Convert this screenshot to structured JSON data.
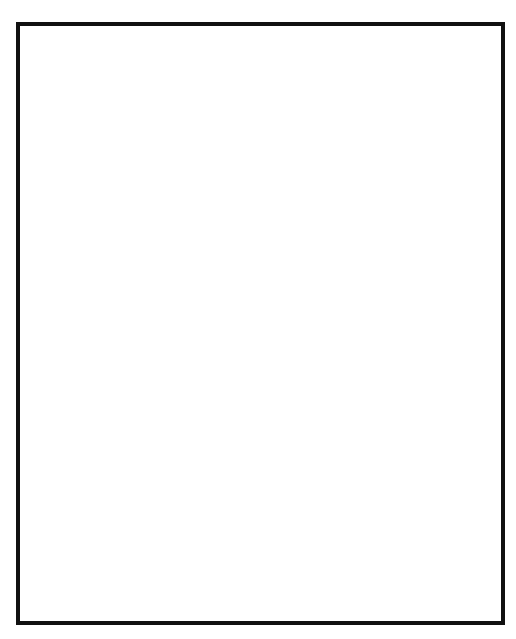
{
  "figure": {
    "kind": "architectural line drawing",
    "frame": {
      "x": 16,
      "y": 22,
      "width": 489,
      "height": 603,
      "stroke": "#111111",
      "stroke_width": 4,
      "fill": "#ffffff"
    },
    "palette": {
      "ink": "#111111",
      "paper": "#ffffff",
      "stipple_dot": "#111111"
    },
    "stipple": {
      "pattern": "regular dot grid",
      "dot_radius": 1.35,
      "spacing": 6.2,
      "region": "right half of drawing, x greater than 253"
    },
    "section_split": {
      "label": "cut plane / stipple boundary",
      "x": 253,
      "y_top": 24,
      "y_bottom": 623
    }
  },
  "elements": {
    "upper_vault": {
      "name": "barrel / groin vault web",
      "course_count": 13,
      "note": "curved horizontal bed joints sweeping from upper left down to the right"
    },
    "central_dome": {
      "name": "central vault cell",
      "cx": 253,
      "cy": 180,
      "rx": 72,
      "ry": 88,
      "ring_voussoirs": 15,
      "inner_courses": 9
    },
    "left_arch": {
      "name": "left semicircular arch",
      "cx": 108,
      "cy": 430,
      "rx": 95,
      "ry": 112,
      "voussoir_count": 17,
      "outer_ring_fill": "plain",
      "inner_ring_fill": "stipple"
    },
    "right_arch": {
      "name": "right semicircular arch",
      "cx": 420,
      "cy": 430,
      "rx": 95,
      "ry": 112,
      "voussoir_count": 17,
      "outer_ring_fill": "stipple",
      "inner_ring_fill": "plain"
    },
    "central_pier": {
      "name": "central pier",
      "x": 208,
      "width": 96,
      "y_top": 408,
      "y_bottom": 623,
      "bands": [
        {
          "label": "band-1",
          "fill": "stipple"
        },
        {
          "label": "band-2",
          "fill": "plain"
        },
        {
          "label": "band-3",
          "fill": "stipple"
        },
        {
          "label": "band-4",
          "fill": "plain"
        }
      ],
      "course_rows": 13
    },
    "left_opening": {
      "name": "left arch opening void",
      "fill": "#ffffff"
    },
    "right_opening": {
      "name": "right arch opening void",
      "fill": "#ffffff"
    }
  }
}
